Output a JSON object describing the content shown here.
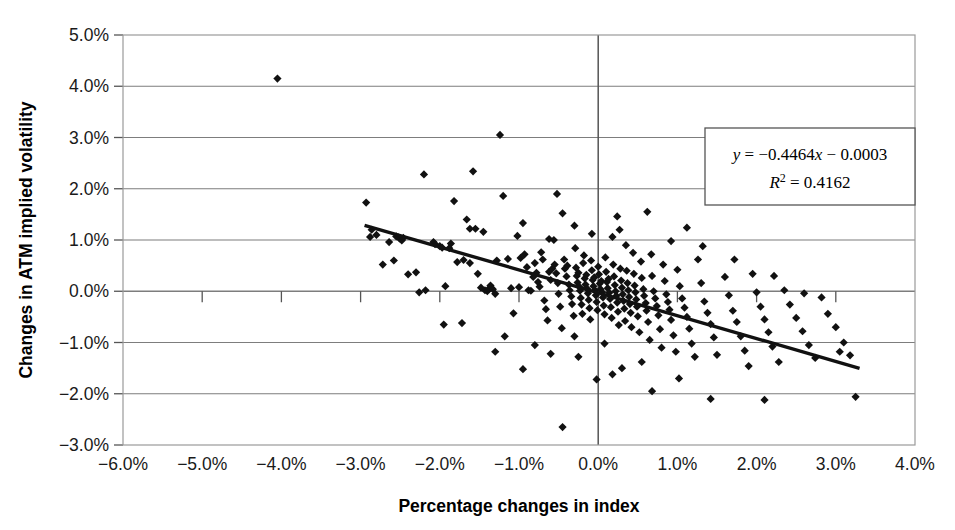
{
  "chart_data": {
    "type": "scatter",
    "title": "",
    "xlabel": "Percentage changes in index",
    "ylabel": "Changes in ATM implied volatility",
    "xlim": [
      -6.0,
      4.0
    ],
    "ylim": [
      -3.0,
      5.0
    ],
    "xtick_labels": [
      "−6.0%",
      "−5.0%",
      "−4.0%",
      "−3.0%",
      "−2.0%",
      "−1.0%",
      "0.0%",
      "1.0%",
      "2.0%",
      "3.0%",
      "4.0%"
    ],
    "xticks": [
      -6.0,
      -5.0,
      -4.0,
      -3.0,
      -2.0,
      -1.0,
      0.0,
      1.0,
      2.0,
      3.0,
      4.0
    ],
    "ytick_labels": [
      "5.0%",
      "4.0%",
      "3.0%",
      "2.0%",
      "1.0%",
      "0.0%",
      "−1.0%",
      "−2.0%",
      "−3.0%"
    ],
    "yticks": [
      5.0,
      4.0,
      3.0,
      2.0,
      1.0,
      0.0,
      -1.0,
      -2.0,
      -3.0
    ],
    "grid": "horizontal-and-zero-vertical",
    "legend": "none",
    "marker": "diamond",
    "marker_color": "#111111",
    "trendline": {
      "equation_text": "y = −0.4464x − 0.0003",
      "r2_text": "R² = 0.4162",
      "slope": -0.4464,
      "intercept": -0.0003,
      "r_squared": 0.4162,
      "x_start": -2.95,
      "x_end": 3.3,
      "color": "#111111"
    },
    "annotation_box": {
      "line1_prefix": "y",
      "line1_rest": " = −0.4464",
      "line1_x": "x",
      "line1_tail": " − 0.0003",
      "line2_prefix": "R",
      "line2_sup": "2",
      "line2_rest": " = 0.4162"
    },
    "points": [
      [
        -4.05,
        4.15
      ],
      [
        -1.24,
        3.05
      ],
      [
        -0.45,
        -2.65
      ],
      [
        3.25,
        -2.06
      ],
      [
        -2.93,
        1.73
      ],
      [
        -2.88,
        1.06
      ],
      [
        -2.86,
        1.2
      ],
      [
        -2.8,
        1.1
      ],
      [
        -2.72,
        0.52
      ],
      [
        -2.64,
        0.96
      ],
      [
        -2.55,
        1.07
      ],
      [
        -2.52,
        1.05
      ],
      [
        -2.5,
        1.02
      ],
      [
        -2.48,
        0.99
      ],
      [
        -2.46,
        1.04
      ],
      [
        -2.3,
        0.37
      ],
      [
        -2.2,
        2.28
      ],
      [
        -2.08,
        0.96
      ],
      [
        -2.06,
        0.92
      ],
      [
        -2.0,
        0.88
      ],
      [
        -1.97,
        0.85
      ],
      [
        -1.93,
        0.1
      ],
      [
        -1.88,
        0.84
      ],
      [
        -1.86,
        0.93
      ],
      [
        -1.78,
        0.57
      ],
      [
        -1.72,
        -0.62
      ],
      [
        -1.7,
        0.61
      ],
      [
        -1.66,
        1.4
      ],
      [
        -1.62,
        0.55
      ],
      [
        -1.58,
        2.34
      ],
      [
        -1.52,
        0.34
      ],
      [
        -1.48,
        0.07
      ],
      [
        -1.43,
        0.02
      ],
      [
        -1.4,
        0.0
      ],
      [
        -1.38,
        0.05
      ],
      [
        -1.36,
        0.11
      ],
      [
        -1.33,
        0.04
      ],
      [
        -1.3,
        -0.05
      ],
      [
        -1.28,
        0.6
      ],
      [
        -1.2,
        1.86
      ],
      [
        -1.14,
        0.63
      ],
      [
        -1.1,
        0.06
      ],
      [
        -1.07,
        -0.43
      ],
      [
        -1.0,
        0.08
      ],
      [
        -0.98,
        0.65
      ],
      [
        -0.95,
        1.33
      ],
      [
        -0.93,
        0.72
      ],
      [
        -0.9,
        0.47
      ],
      [
        -0.88,
        0.02
      ],
      [
        -0.85,
        0.01
      ],
      [
        -0.82,
        0.28
      ],
      [
        -0.8,
        0.55
      ],
      [
        -0.78,
        0.36
      ],
      [
        -0.76,
        0.18
      ],
      [
        -0.74,
        0.09
      ],
      [
        -0.72,
        0.76
      ],
      [
        -0.7,
        0.62
      ],
      [
        -0.68,
        -0.18
      ],
      [
        -0.66,
        -0.35
      ],
      [
        -0.64,
        -0.57
      ],
      [
        -0.62,
        0.38
      ],
      [
        -0.6,
        0.22
      ],
      [
        -0.58,
        0.44
      ],
      [
        -0.56,
        1.0
      ],
      [
        -0.55,
        0.52
      ],
      [
        -0.53,
        0.35
      ],
      [
        -0.51,
        0.16
      ],
      [
        -0.5,
        -0.05
      ],
      [
        -0.48,
        -0.3
      ],
      [
        -0.46,
        -0.72
      ],
      [
        -0.45,
        1.52
      ],
      [
        -0.43,
        0.62
      ],
      [
        -0.42,
        0.44
      ],
      [
        -0.4,
        0.29
      ],
      [
        -0.39,
        0.5
      ],
      [
        -0.37,
        0.13
      ],
      [
        -0.36,
        0.02
      ],
      [
        -0.34,
        -0.1
      ],
      [
        -0.33,
        -0.25
      ],
      [
        -0.31,
        -0.48
      ],
      [
        -0.3,
        -0.88
      ],
      [
        -0.29,
        0.84
      ],
      [
        -0.28,
        0.46
      ],
      [
        -0.27,
        0.3
      ],
      [
        -0.26,
        0.17
      ],
      [
        -0.25,
        0.36
      ],
      [
        -0.24,
        0.09
      ],
      [
        -0.23,
        0.01
      ],
      [
        -0.22,
        -0.13
      ],
      [
        -0.21,
        -0.26
      ],
      [
        -0.2,
        -0.44
      ],
      [
        -0.19,
        0.55
      ],
      [
        -0.18,
        0.7
      ],
      [
        -0.17,
        0.25
      ],
      [
        -0.16,
        0.13
      ],
      [
        -0.15,
        0.32
      ],
      [
        -0.14,
        0.05
      ],
      [
        -0.13,
        -0.04
      ],
      [
        -0.12,
        -0.17
      ],
      [
        -0.11,
        -0.33
      ],
      [
        -0.1,
        -0.55
      ],
      [
        -0.09,
        0.6
      ],
      [
        -0.08,
        0.41
      ],
      [
        -0.07,
        0.22
      ],
      [
        -0.06,
        0.1
      ],
      [
        -0.05,
        0.27
      ],
      [
        -0.04,
        0.02
      ],
      [
        -0.03,
        -0.08
      ],
      [
        -0.02,
        -0.21
      ],
      [
        -0.01,
        -0.37
      ],
      [
        0.0,
        0.48
      ],
      [
        0.01,
        0.33
      ],
      [
        0.02,
        0.15
      ],
      [
        0.03,
        0.04
      ],
      [
        0.04,
        0.2
      ],
      [
        0.05,
        -0.02
      ],
      [
        0.06,
        -0.12
      ],
      [
        0.07,
        -0.28
      ],
      [
        0.08,
        -0.45
      ],
      [
        0.09,
        0.66
      ],
      [
        0.1,
        0.38
      ],
      [
        0.11,
        0.18
      ],
      [
        0.12,
        0.06
      ],
      [
        0.13,
        0.24
      ],
      [
        0.14,
        -0.03
      ],
      [
        0.15,
        -0.15
      ],
      [
        0.16,
        -0.31
      ],
      [
        0.17,
        -0.52
      ],
      [
        0.18,
        1.06
      ],
      [
        0.19,
        0.52
      ],
      [
        0.2,
        0.29
      ],
      [
        0.21,
        0.12
      ],
      [
        0.22,
        0.0
      ],
      [
        0.23,
        -0.09
      ],
      [
        0.24,
        -0.22
      ],
      [
        0.25,
        -0.4
      ],
      [
        0.26,
        -0.66
      ],
      [
        0.27,
        1.2
      ],
      [
        0.28,
        0.44
      ],
      [
        0.29,
        0.21
      ],
      [
        0.3,
        0.07
      ],
      [
        0.31,
        -0.06
      ],
      [
        0.32,
        -0.19
      ],
      [
        0.33,
        -0.34
      ],
      [
        0.34,
        -0.58
      ],
      [
        0.35,
        0.9
      ],
      [
        0.36,
        0.4
      ],
      [
        0.37,
        0.16
      ],
      [
        0.38,
        0.02
      ],
      [
        0.39,
        -0.11
      ],
      [
        0.4,
        -0.25
      ],
      [
        0.41,
        -0.42
      ],
      [
        0.42,
        -0.7
      ],
      [
        0.44,
        0.75
      ],
      [
        0.45,
        0.34
      ],
      [
        0.46,
        0.11
      ],
      [
        0.47,
        -0.02
      ],
      [
        0.48,
        -0.16
      ],
      [
        0.49,
        -0.3
      ],
      [
        0.5,
        -0.49
      ],
      [
        0.52,
        -0.8
      ],
      [
        0.54,
        0.58
      ],
      [
        0.55,
        0.26
      ],
      [
        0.57,
        0.04
      ],
      [
        0.58,
        -0.09
      ],
      [
        0.6,
        -0.23
      ],
      [
        0.61,
        -0.38
      ],
      [
        0.63,
        -0.6
      ],
      [
        0.65,
        -0.95
      ],
      [
        0.67,
        0.72
      ],
      [
        0.68,
        0.3
      ],
      [
        0.7,
        0.0
      ],
      [
        0.72,
        -0.14
      ],
      [
        0.74,
        -0.29
      ],
      [
        0.76,
        -0.47
      ],
      [
        0.78,
        -0.74
      ],
      [
        0.8,
        -1.1
      ],
      [
        0.82,
        0.52
      ],
      [
        0.84,
        0.2
      ],
      [
        0.86,
        -0.06
      ],
      [
        0.88,
        -0.21
      ],
      [
        0.9,
        -0.36
      ],
      [
        0.92,
        -0.56
      ],
      [
        0.95,
        -0.86
      ],
      [
        0.98,
        -1.18
      ],
      [
        1.0,
        0.42
      ],
      [
        1.03,
        0.1
      ],
      [
        1.06,
        -0.14
      ],
      [
        1.09,
        -0.32
      ],
      [
        1.12,
        -0.5
      ],
      [
        1.15,
        -0.73
      ],
      [
        1.18,
        -1.02
      ],
      [
        1.22,
        -1.28
      ],
      [
        1.26,
        0.62
      ],
      [
        1.3,
        0.16
      ],
      [
        1.34,
        -0.2
      ],
      [
        1.38,
        -0.42
      ],
      [
        1.42,
        -0.64
      ],
      [
        1.46,
        -0.9
      ],
      [
        1.5,
        -1.24
      ],
      [
        1.55,
        1.78
      ],
      [
        1.6,
        0.28
      ],
      [
        1.65,
        -0.08
      ],
      [
        1.7,
        -0.38
      ],
      [
        1.75,
        -0.6
      ],
      [
        1.8,
        -0.88
      ],
      [
        1.85,
        -1.16
      ],
      [
        1.9,
        -1.46
      ],
      [
        1.95,
        0.34
      ],
      [
        2.0,
        -0.02
      ],
      [
        2.05,
        -0.3
      ],
      [
        2.1,
        -0.55
      ],
      [
        2.15,
        -0.8
      ],
      [
        2.2,
        -1.08
      ],
      [
        2.28,
        -1.38
      ],
      [
        2.35,
        0.02
      ],
      [
        2.42,
        -0.26
      ],
      [
        2.5,
        -0.52
      ],
      [
        2.58,
        -0.78
      ],
      [
        2.66,
        -1.05
      ],
      [
        2.74,
        -1.3
      ],
      [
        2.82,
        -0.12
      ],
      [
        2.9,
        -0.44
      ],
      [
        3.0,
        -0.7
      ],
      [
        3.1,
        -1.0
      ],
      [
        3.18,
        -1.25
      ],
      [
        1.42,
        -2.1
      ],
      [
        2.1,
        -2.12
      ],
      [
        0.68,
        -1.95
      ],
      [
        1.02,
        -1.7
      ],
      [
        -0.8,
        -1.05
      ],
      [
        -1.95,
        -0.65
      ],
      [
        -2.18,
        0.02
      ],
      [
        -2.26,
        -0.02
      ],
      [
        -2.4,
        0.33
      ],
      [
        -1.3,
        -1.18
      ],
      [
        -0.95,
        -1.52
      ],
      [
        0.18,
        -1.62
      ],
      [
        0.55,
        -1.38
      ],
      [
        -0.62,
        1.02
      ],
      [
        -1.02,
        1.08
      ],
      [
        -0.3,
        1.28
      ],
      [
        -1.55,
        1.22
      ],
      [
        -2.58,
        0.6
      ],
      [
        -0.25,
        -1.28
      ],
      [
        0.08,
        -1.02
      ],
      [
        0.3,
        -1.5
      ],
      [
        1.72,
        0.62
      ],
      [
        2.22,
        0.3
      ],
      [
        2.6,
        -0.04
      ],
      [
        3.05,
        -1.18
      ],
      [
        -1.82,
        1.76
      ],
      [
        -1.62,
        1.22
      ],
      [
        -1.45,
        1.16
      ],
      [
        -0.52,
        1.9
      ],
      [
        0.62,
        1.55
      ],
      [
        0.24,
        1.46
      ],
      [
        -0.08,
        1.12
      ],
      [
        1.12,
        1.24
      ],
      [
        0.92,
        0.98
      ],
      [
        1.32,
        0.88
      ],
      [
        -0.02,
        -1.72
      ],
      [
        -0.6,
        -1.22
      ],
      [
        -1.18,
        -0.88
      ]
    ]
  },
  "axis": {
    "y_title": "Changes in ATM implied volatility",
    "x_title": "Percentage changes in index"
  }
}
